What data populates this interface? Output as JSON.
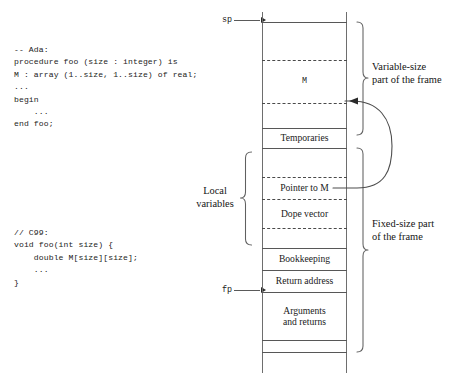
{
  "code_blocks": [
    {
      "id": "ada",
      "language_comment": "-- Ada:",
      "text": "-- Ada:\nprocedure foo (size : integer) is\nM : array (1..size, 1..size) of real;\n...\nbegin\n    ...\nend foo;"
    },
    {
      "id": "c99",
      "language_comment": "// C99:",
      "text": "// C99:\nvoid foo(int size) {\n    double M[size][size];\n    ...\n}"
    }
  ],
  "pointers": [
    {
      "name": "sp",
      "label": "sp",
      "target_y": 22
    },
    {
      "name": "fp",
      "label": "fp",
      "target_y": 292
    }
  ],
  "stack": {
    "cells": [
      {
        "name": "top-gap",
        "label": "",
        "top": 22,
        "height": 38,
        "mono": false
      },
      {
        "name": "m-array",
        "label": "M",
        "top": 60,
        "height": 43,
        "mono": true
      },
      {
        "name": "m-lower-gap",
        "label": "",
        "top": 103,
        "height": 25,
        "mono": false
      },
      {
        "name": "temporaries",
        "label": "Temporaries",
        "top": 128,
        "height": 20,
        "mono": false
      },
      {
        "name": "temporaries-gap",
        "label": "",
        "top": 148,
        "height": 29,
        "mono": false
      },
      {
        "name": "pointer-to-m",
        "label": "Pointer to M",
        "top": 177,
        "height": 22,
        "mono": false
      },
      {
        "name": "dope-vector",
        "label": "Dope vector",
        "top": 199,
        "height": 29,
        "mono": false
      },
      {
        "name": "locals-gap",
        "label": "",
        "top": 228,
        "height": 20,
        "mono": false
      },
      {
        "name": "bookkeeping",
        "label": "Bookkeeping",
        "top": 248,
        "height": 22,
        "mono": false
      },
      {
        "name": "return-address",
        "label": "Return address",
        "top": 270,
        "height": 22,
        "mono": false
      },
      {
        "name": "arguments",
        "label": "Arguments\nand returns",
        "top": 292,
        "height": 48,
        "mono": false
      },
      {
        "name": "bottom-gap",
        "label": "",
        "top": 340,
        "height": 12,
        "mono": false
      }
    ],
    "solid_dividers": [
      22,
      128,
      148,
      248,
      270,
      292,
      340,
      352
    ],
    "dashed_dividers": [
      60,
      103,
      177,
      199,
      228
    ]
  },
  "annotations": [
    {
      "name": "variable-size-label",
      "text": "Variable-size",
      "text2": "part of the frame"
    },
    {
      "name": "fixed-size-label",
      "text": "Fixed-size part",
      "text2": "of the frame"
    },
    {
      "name": "local-variables-label",
      "text": "Local",
      "text2": "variables"
    }
  ],
  "connector": {
    "name": "pointer-to-m-arrow",
    "from_cell": "pointer-to-m",
    "to_cell": "m-array",
    "description": "curved arrow from Pointer to M slot to the M region"
  },
  "colors": {
    "ink": "#1a1a1a",
    "rule": "#575757",
    "rail": "#6e6e6e",
    "background": "#ffffff"
  }
}
